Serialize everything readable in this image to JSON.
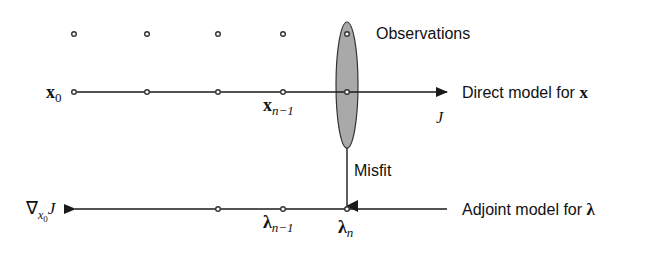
{
  "diagram": {
    "labels": {
      "observations": "Observations",
      "direct_model": "Direct model for ",
      "direct_model_var": "x",
      "adjoint_model": "Adjoint model for ",
      "adjoint_model_var": "λ",
      "misfit": "Misfit",
      "cost": "J",
      "x0_base": "x",
      "x0_sub": "0",
      "xn1_base": "x",
      "xn1_sub": "n−1",
      "lambda_n1_base": "λ",
      "lambda_n1_sub": "n−1",
      "lambda_n_base": "λ",
      "lambda_n_sub": "n",
      "gradient_nabla": "∇",
      "gradient_sub": "x",
      "gradient_subsub": "0",
      "gradient_J": "J"
    },
    "colors": {
      "line": "#1a1a1a",
      "ellipse_fill": "#a9a9a9",
      "ellipse_stroke": "#333333",
      "background": "#ffffff"
    }
  }
}
